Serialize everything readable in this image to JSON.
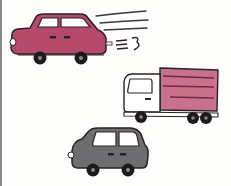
{
  "scene": {
    "description": "Hand-drawn illustration of three vehicles",
    "colors": {
      "outline": "#2a2226",
      "pink": "#b64a6c",
      "pink_light": "#c9708c",
      "gray": "#6e6e70",
      "white": "#ffffff",
      "window": "#ffffff"
    },
    "vehicles": [
      {
        "name": "pink-car",
        "type": "car",
        "color": "pink",
        "motion": "speed-lines",
        "exhaust_symbol": "=3"
      },
      {
        "name": "pink-truck",
        "type": "truck",
        "cargo_color": "pink_light",
        "cab_color": "white"
      },
      {
        "name": "gray-car",
        "type": "car",
        "color": "gray"
      }
    ],
    "exhaust_text": "=3"
  }
}
